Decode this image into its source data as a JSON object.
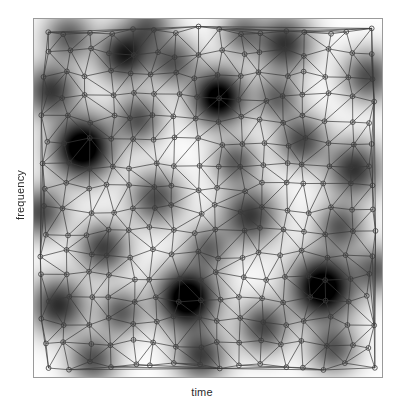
{
  "figure": {
    "background_color": "#ffffff",
    "frame_color": "#9a9a9a"
  },
  "axes": {
    "xlabel": "time",
    "ylabel": "frequency",
    "xticks": [],
    "yticks": [],
    "frame_visible": true
  },
  "chart_data": {
    "type": "heatmap",
    "title": "",
    "xlabel": "time",
    "ylabel": "frequency",
    "xlim": [
      0,
      1
    ],
    "ylim": [
      0,
      1
    ],
    "grid": false,
    "legend": "none",
    "colormap": "gray_reversed",
    "field": {
      "kind": "sum-of-gaussian-blobs",
      "value_range": [
        0,
        1
      ],
      "dark_is_high_energy": true,
      "blob_sigma_range": [
        0.035,
        0.085
      ],
      "blobs": [
        {
          "x": 0.14,
          "y": 0.64,
          "amp": 1.0,
          "sigma": 0.055
        },
        {
          "x": 0.53,
          "y": 0.78,
          "amp": 0.92,
          "sigma": 0.05
        },
        {
          "x": 0.44,
          "y": 0.22,
          "amp": 1.0,
          "sigma": 0.055
        },
        {
          "x": 0.83,
          "y": 0.25,
          "amp": 0.98,
          "sigma": 0.058
        },
        {
          "x": 0.26,
          "y": 0.9,
          "amp": 0.7,
          "sigma": 0.048
        },
        {
          "x": 0.72,
          "y": 0.93,
          "amp": 0.6,
          "sigma": 0.05
        },
        {
          "x": 0.07,
          "y": 0.2,
          "amp": 0.62,
          "sigma": 0.05
        },
        {
          "x": 0.62,
          "y": 0.45,
          "amp": 0.58,
          "sigma": 0.052
        },
        {
          "x": 0.35,
          "y": 0.5,
          "amp": 0.5,
          "sigma": 0.048
        },
        {
          "x": 0.92,
          "y": 0.58,
          "amp": 0.6,
          "sigma": 0.05
        },
        {
          "x": 0.2,
          "y": 0.36,
          "amp": 0.55,
          "sigma": 0.046
        },
        {
          "x": 0.05,
          "y": 0.8,
          "amp": 0.58,
          "sigma": 0.048
        },
        {
          "x": 0.48,
          "y": 0.06,
          "amp": 0.55,
          "sigma": 0.046
        },
        {
          "x": 0.77,
          "y": 0.66,
          "amp": 0.52,
          "sigma": 0.046
        },
        {
          "x": 0.96,
          "y": 0.84,
          "amp": 0.5,
          "sigma": 0.046
        },
        {
          "x": 0.3,
          "y": 0.72,
          "amp": 0.48,
          "sigma": 0.044
        },
        {
          "x": 0.66,
          "y": 0.14,
          "amp": 0.52,
          "sigma": 0.046
        },
        {
          "x": 0.88,
          "y": 0.42,
          "amp": 0.46,
          "sigma": 0.044
        },
        {
          "x": 0.17,
          "y": 0.05,
          "amp": 0.48,
          "sigma": 0.044
        },
        {
          "x": 0.58,
          "y": 0.6,
          "amp": 0.44,
          "sigma": 0.042
        },
        {
          "x": 0.4,
          "y": 0.88,
          "amp": 0.46,
          "sigma": 0.044
        },
        {
          "x": 0.02,
          "y": 0.46,
          "amp": 0.5,
          "sigma": 0.046
        },
        {
          "x": 0.7,
          "y": 0.78,
          "amp": 0.42,
          "sigma": 0.042
        },
        {
          "x": 0.25,
          "y": 0.18,
          "amp": 0.44,
          "sigma": 0.042
        },
        {
          "x": 0.86,
          "y": 0.08,
          "amp": 0.46,
          "sigma": 0.044
        },
        {
          "x": 0.5,
          "y": 0.36,
          "amp": 0.4,
          "sigma": 0.042
        },
        {
          "x": 0.1,
          "y": 0.95,
          "amp": 0.44,
          "sigma": 0.044
        },
        {
          "x": 0.98,
          "y": 0.3,
          "amp": 0.42,
          "sigma": 0.042
        },
        {
          "x": 0.33,
          "y": 0.98,
          "amp": 0.4,
          "sigma": 0.042
        },
        {
          "x": 0.6,
          "y": 0.96,
          "amp": 0.38,
          "sigma": 0.04
        }
      ]
    },
    "mesh": {
      "kind": "delaunay-triangulation",
      "vertex_count": 230,
      "marker": "open-circle",
      "marker_radius_px": 2.4,
      "edge_color": "#3a3a3a",
      "edge_width_px": 0.7,
      "point_distribution": "jittered-grid",
      "grid_cols": 16,
      "grid_rows": 16,
      "jitter": 0.42,
      "seed": 20240517
    }
  }
}
